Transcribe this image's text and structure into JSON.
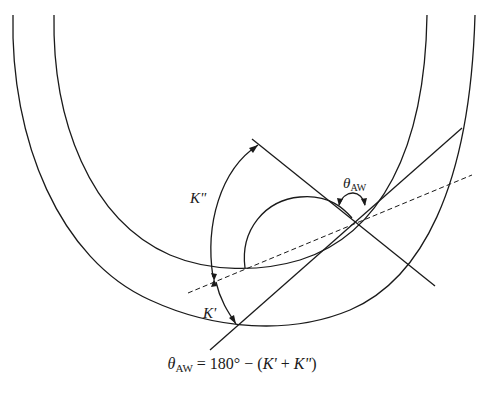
{
  "diagram": {
    "type": "contact angle geometry",
    "labels": {
      "k_double_prime": "K\"",
      "k_prime": "K'",
      "theta_symbol": "θ",
      "theta_subscript": "AW"
    },
    "equation": {
      "lhs_symbol": "θ",
      "lhs_subscript": "AW",
      "rhs": " = 180° − (",
      "k_prime": "K'",
      "plus": " + ",
      "k_double_prime": "K\"",
      "close": ")"
    },
    "colors": {
      "stroke": "#1a1a1a",
      "background": "#ffffff"
    }
  }
}
